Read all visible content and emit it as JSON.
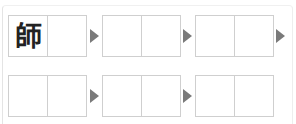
{
  "exercise": {
    "rows": [
      {
        "boxes": [
          {
            "cells": [
              "師",
              ""
            ]
          },
          {
            "cells": [
              "",
              ""
            ]
          },
          {
            "cells": [
              "",
              ""
            ]
          }
        ],
        "arrows_after": [
          true,
          true,
          true
        ]
      },
      {
        "boxes": [
          {
            "cells": [
              "",
              ""
            ]
          },
          {
            "cells": [
              "",
              ""
            ]
          },
          {
            "cells": [
              "",
              ""
            ]
          }
        ],
        "arrows_after": [
          true,
          true,
          false
        ]
      }
    ]
  },
  "colors": {
    "box_border": "#cfcfcf",
    "arrow": "#7a7a7a",
    "text": "#222222"
  }
}
